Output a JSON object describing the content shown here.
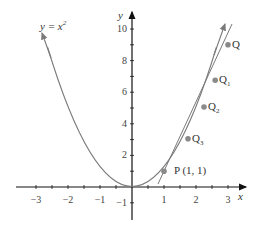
{
  "diagram": {
    "curve_label": "y = x",
    "curve_label_exp": "2",
    "x_axis_label": "x",
    "y_axis_label": "y",
    "x_ticks": [
      "−3",
      "−2",
      "−1",
      "1",
      "2",
      "3"
    ],
    "y_ticks": [
      "10",
      "8",
      "6",
      "4",
      "2",
      "−1"
    ],
    "points": [
      {
        "name": "P",
        "label": "P (1, 1)",
        "x": 1,
        "y": 1
      },
      {
        "name": "Q3",
        "label": "Q",
        "sub": "3",
        "x": 1.75,
        "y": 3.06
      },
      {
        "name": "Q2",
        "label": "Q",
        "sub": "2",
        "x": 2.25,
        "y": 5.06
      },
      {
        "name": "Q1",
        "label": "Q",
        "sub": "1",
        "x": 2.6,
        "y": 6.76
      },
      {
        "name": "Q",
        "label": "Q",
        "sub": "",
        "x": 3,
        "y": 9
      }
    ],
    "colors": {
      "curve": "#7a7a7a",
      "axis": "#111111",
      "point": "#8a8a8a"
    }
  }
}
